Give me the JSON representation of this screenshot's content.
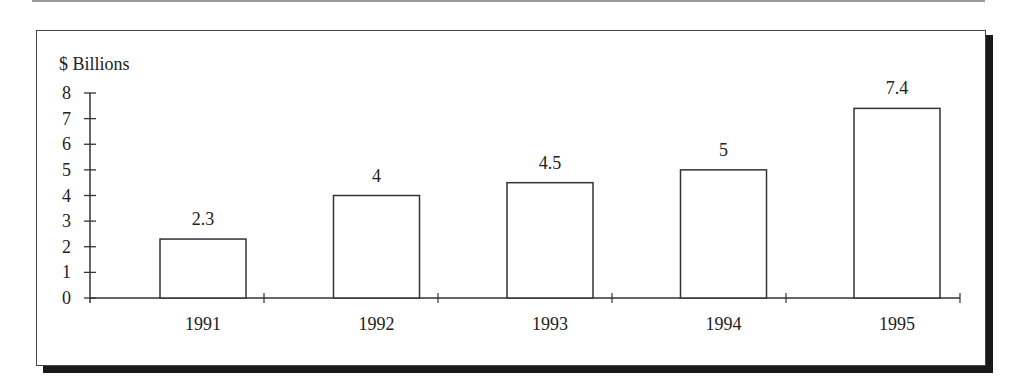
{
  "chart_data": {
    "type": "bar",
    "title": "",
    "ylabel": "$ Billions",
    "xlabel": "",
    "categories": [
      "1991",
      "1992",
      "1993",
      "1994",
      "1995"
    ],
    "values": [
      2.3,
      4,
      4.5,
      5,
      7.4
    ],
    "data_labels": [
      "2.3",
      "4",
      "4.5",
      "5",
      "7.4"
    ],
    "ylim": [
      0,
      8
    ],
    "yticks": [
      0,
      1,
      2,
      3,
      4,
      5,
      6,
      7,
      8
    ],
    "grid": false,
    "legend": null,
    "bar_fill": "#ffffff",
    "bar_stroke": "#333333"
  }
}
